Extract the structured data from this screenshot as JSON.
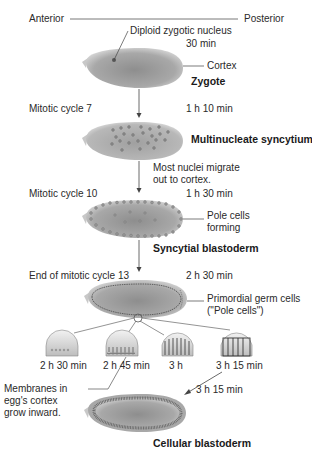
{
  "axis": {
    "anterior": "Anterior",
    "posterior": "Posterior"
  },
  "stages": [
    {
      "name": "Zygote",
      "time": "30 min",
      "annotations": [
        "Diploid zygotic nucleus",
        "Cortex"
      ]
    },
    {
      "name": "Multinucleate syncytium",
      "time": "1 h 10 min",
      "cycle": "Mitotic cycle 7"
    },
    {
      "name": "Syncytial blastoderm",
      "time": "1 h 30 min",
      "cycle": "Mitotic cycle 10",
      "transition_note_line1": "Most nuclei migrate",
      "transition_note_line2": "out to cortex.",
      "annotations_line1": "Pole cells",
      "annotations_line2": "forming"
    },
    {
      "name": "End of mitotic cycle 13",
      "time": "2 h 30 min",
      "annotation_line1": "Primordial germ cells",
      "annotation_line2": "(\"Pole cells\")"
    },
    {
      "name": "Cellular blastoderm",
      "time": "3 h 15 min"
    }
  ],
  "cellularization": {
    "insets": [
      {
        "time": "2 h 30 min"
      },
      {
        "time": "2 h 45 min"
      },
      {
        "time": "3 h"
      },
      {
        "time": "3 h 15 min"
      }
    ],
    "note_line1": "Membranes in",
    "note_line2": "egg's cortex",
    "note_line3": "grow inward."
  },
  "colors": {
    "embryo_fill": "#9a9a9a",
    "embryo_light": "#d6d6d6",
    "nucleus": "#7a7a7a",
    "line": "#444444"
  }
}
